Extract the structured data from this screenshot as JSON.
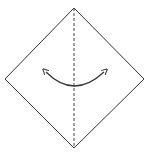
{
  "diagram": {
    "type": "origami-fold-step",
    "colors": {
      "background": "#ffffff",
      "stroke": "#333333",
      "fold_line": "#444444"
    },
    "shapes": {
      "paper": {
        "kind": "diamond",
        "vertices": {
          "top": [
            74,
            8
          ],
          "right": [
            144,
            79
          ],
          "bottom": [
            74,
            148
          ],
          "left": [
            5,
            79
          ]
        }
      },
      "fold_line": {
        "kind": "valley-fold-dashed",
        "from": [
          74,
          8
        ],
        "to": [
          74,
          148
        ]
      },
      "arrow": {
        "kind": "double-headed-curved",
        "meaning": "fold-and-unfold",
        "start": [
          45,
          71
        ],
        "control": [
          74,
          100
        ],
        "end": [
          105,
          71
        ]
      }
    }
  }
}
